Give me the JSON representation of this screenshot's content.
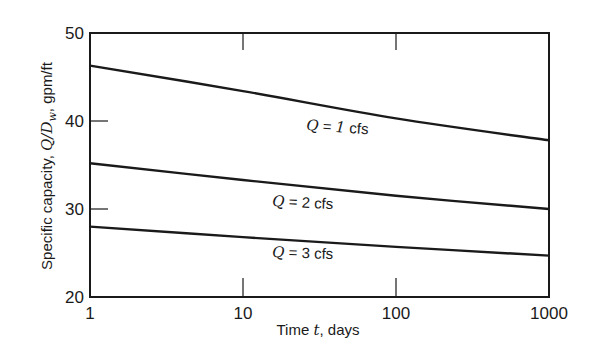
{
  "chart_data": {
    "type": "line",
    "title": "",
    "xlabel": "Time t, days",
    "ylabel": "Specific capacity, Q/D_w, gpm/ft",
    "xscale": "log",
    "xlim": [
      1,
      1000
    ],
    "ylim": [
      20,
      50
    ],
    "xticks": [
      1,
      10,
      100,
      1000
    ],
    "xtick_labels": [
      "1",
      "10",
      "100",
      "1000"
    ],
    "yticks": [
      20,
      30,
      40,
      50
    ],
    "ytick_labels": [
      "20",
      "30",
      "40",
      "50"
    ],
    "grid": false,
    "legend": "inline curve labels",
    "x": [
      1,
      10,
      100,
      1000
    ],
    "series": [
      {
        "name": "Q = 1 cfs",
        "values": [
          46.3,
          43.4,
          40.3,
          37.8
        ]
      },
      {
        "name": "Q = 2 cfs",
        "values": [
          35.2,
          33.3,
          31.5,
          30.0
        ]
      },
      {
        "name": "Q = 3 cfs",
        "values": [
          28.0,
          26.8,
          25.7,
          24.7
        ]
      }
    ]
  },
  "labels": {
    "xlabel_pre": "Time ",
    "xlabel_var": "t",
    "xlabel_post": ", days",
    "ylabel_pre": "Specific capacity, ",
    "ylabel_var": "Q/D",
    "ylabel_sub": "w",
    "ylabel_post": ", gpm/ft",
    "curve_var": "Q",
    "curve_eq": " = ",
    "curve_values": [
      "1",
      "2",
      "3"
    ],
    "curve_unit": " cfs"
  },
  "colors": {
    "line": "#1a1a1a",
    "background": "#ffffff"
  }
}
